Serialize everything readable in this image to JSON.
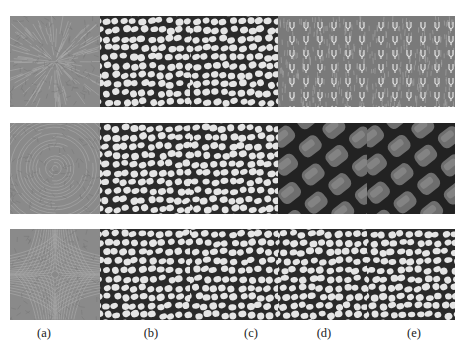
{
  "figure": {
    "rows": [
      {
        "name": "row-1",
        "field_pattern": "radial-source",
        "panels": [
          "field",
          "cells",
          "cells",
          "glyph-texture",
          "glyph-texture"
        ]
      },
      {
        "name": "row-2",
        "field_pattern": "concentric-vortex",
        "panels": [
          "field",
          "cells",
          "cells",
          "weave",
          "weave"
        ]
      },
      {
        "name": "row-3",
        "field_pattern": "saddle",
        "panels": [
          "field",
          "cells",
          "cells",
          "cells",
          "cells"
        ]
      }
    ],
    "column_labels": [
      "(a)",
      "(b)",
      "(c)",
      "(d)",
      "(e)"
    ]
  },
  "colors": {
    "background": "#ffffff",
    "field_gray": "#8a8a8a",
    "cell_light": "#efefef",
    "cell_dark": "#2a2a2a",
    "weave_mid": "#6e6e6e"
  }
}
